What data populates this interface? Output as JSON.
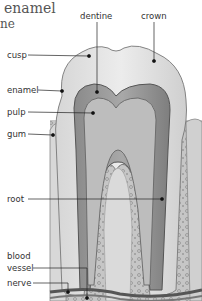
{
  "diagram": {
    "cropped_text": {
      "line1": "enamel",
      "line2": "ne"
    },
    "labels": [
      {
        "id": "dentine",
        "text": "dentine",
        "x": 80,
        "y": 12
      },
      {
        "id": "crown",
        "text": "crown",
        "x": 141,
        "y": 12
      },
      {
        "id": "cusp",
        "text": "cusp",
        "x": 7,
        "y": 51
      },
      {
        "id": "enamel",
        "text": "enamel",
        "x": 7,
        "y": 86
      },
      {
        "id": "pulp",
        "text": "pulp",
        "x": 7,
        "y": 108
      },
      {
        "id": "gum",
        "text": "gum",
        "x": 7,
        "y": 130
      },
      {
        "id": "root",
        "text": "root",
        "x": 7,
        "y": 193
      },
      {
        "id": "blood",
        "text": "blood",
        "x": 7,
        "y": 250
      },
      {
        "id": "vessel",
        "text": "vessel",
        "x": 7,
        "y": 262
      },
      {
        "id": "nerve",
        "text": "nerve",
        "x": 7,
        "y": 278
      }
    ],
    "colors": {
      "background": "#ffffff",
      "enamel": "#dcdcdc",
      "dentine": "#9a9a9a",
      "pulp": "#b8b8b8",
      "bone": "#c8c8c8",
      "leader": "#222222"
    }
  }
}
